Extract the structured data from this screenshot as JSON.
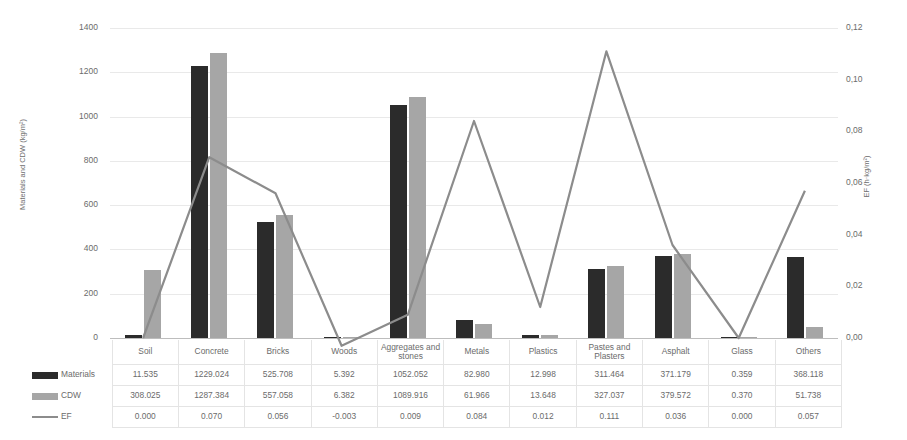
{
  "chart_data": {
    "type": "bar",
    "title": "",
    "subtitle": "",
    "xlabel": "",
    "ylabel": "Materials and CDW (kg/m²)",
    "y2label": "EF (h·kg/m²)",
    "grid": true,
    "legend_position": "table-left",
    "ylim": [
      0,
      1400
    ],
    "y2lim": [
      0,
      0.12
    ],
    "yticks": [
      "0",
      "200",
      "400",
      "600",
      "800",
      "1000",
      "1200",
      "1400"
    ],
    "y2ticks": [
      "0,00",
      "0,02",
      "0,04",
      "0,06",
      "0,08",
      "0,10",
      "0,12"
    ],
    "categories": [
      "Soil",
      "Concrete",
      "Bricks",
      "Woods",
      "Aggregates and stones",
      "Metals",
      "Plastics",
      "Pastes and Plasters",
      "Asphalt",
      "Glass",
      "Others"
    ],
    "series": [
      {
        "name": "Materials",
        "kind": "bar",
        "axis": "left",
        "color": "#2b2b2b",
        "values": [
          11.535,
          1229.024,
          525.708,
          5.392,
          1052.052,
          82.98,
          12.998,
          311.464,
          371.179,
          0.359,
          368.118
        ],
        "labels": [
          "11.535",
          "1229.024",
          "525.708",
          "5.392",
          "1052.052",
          "82.980",
          "12.998",
          "311.464",
          "371.179",
          "0.359",
          "368.118"
        ]
      },
      {
        "name": "CDW",
        "kind": "bar",
        "axis": "left",
        "color": "#a6a6a6",
        "values": [
          308.025,
          1287.384,
          557.058,
          6.382,
          1089.916,
          61.966,
          13.648,
          327.037,
          379.572,
          0.37,
          51.738
        ],
        "labels": [
          "308.025",
          "1287.384",
          "557.058",
          "6.382",
          "1089.916",
          "61.966",
          "13.648",
          "327.037",
          "379.572",
          "0.370",
          "51.738"
        ]
      },
      {
        "name": "EF",
        "kind": "line",
        "axis": "right",
        "color": "#8c8c8c",
        "values": [
          0.0,
          0.07,
          0.056,
          -0.003,
          0.009,
          0.084,
          0.012,
          0.111,
          0.036,
          0.0,
          0.057
        ],
        "labels": [
          "0.000",
          "0.070",
          "0.056",
          "-0.003",
          "0.009",
          "0.084",
          "0.012",
          "0.111",
          "0.036",
          "0.000",
          "0.057"
        ]
      }
    ]
  },
  "table": {
    "corner": "",
    "row_labels": [
      "Materials",
      "CDW",
      "EF"
    ]
  }
}
